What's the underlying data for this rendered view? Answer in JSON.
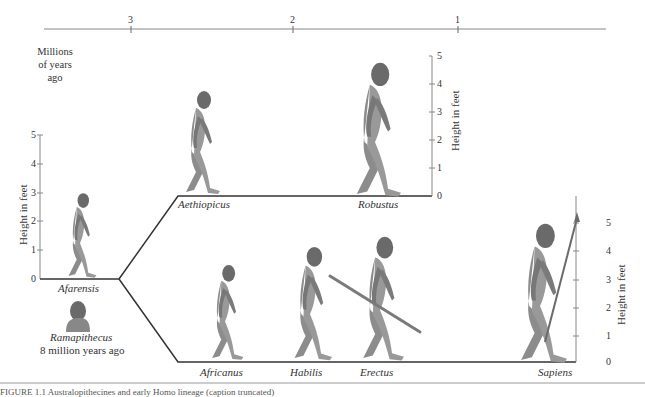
{
  "timeline": {
    "ticks": [
      {
        "label": "3",
        "x": 131
      },
      {
        "label": "2",
        "x": 293
      },
      {
        "label": "1",
        "x": 458
      }
    ],
    "axis_label": "Millions of years ago",
    "axis_label_lines": [
      "Millions",
      "of years",
      "ago"
    ]
  },
  "height_axis": {
    "title": "Height in feet",
    "ticks": [
      "0",
      "1",
      "2",
      "3",
      "4",
      "5"
    ]
  },
  "species": {
    "afarensis": {
      "label": "Afarensis"
    },
    "ramapithecus": {
      "label": "Ramapithecus",
      "sublabel": "8 million years ago"
    },
    "aethiopicus": {
      "label": "Aethiopicus"
    },
    "robustus": {
      "label": "Robustus"
    },
    "africanus": {
      "label": "Africanus"
    },
    "habilis": {
      "label": "Habilis"
    },
    "erectus": {
      "label": "Erectus"
    },
    "sapiens": {
      "label": "Sapiens"
    }
  },
  "colors": {
    "line": "#333333",
    "figure": "#8c8c8c",
    "figure_dark": "#5e5e5e",
    "timeline": "#888888"
  },
  "caption": "FIGURE 1.1 Australopithecines and early Homo lineage (caption truncated)"
}
